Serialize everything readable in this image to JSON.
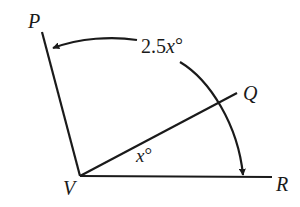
{
  "diagram": {
    "points": {
      "P": "P",
      "Q": "Q",
      "R": "R",
      "V": "V"
    },
    "angles": {
      "inner": {
        "coef": "",
        "var": "x",
        "deg": "°"
      },
      "outer": {
        "coef": "2.5",
        "var": "x",
        "deg": "°"
      }
    },
    "colors": {
      "stroke": "#1a1a1a",
      "background": "#ffffff"
    }
  }
}
